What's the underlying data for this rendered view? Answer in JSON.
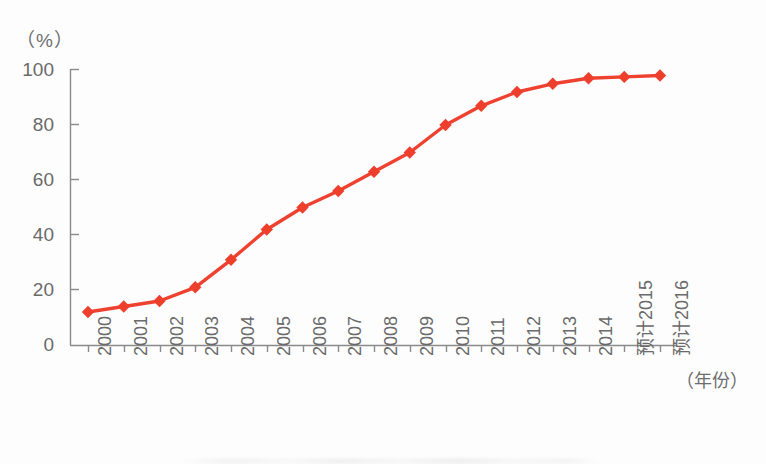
{
  "chart_data": {
    "type": "line",
    "title": "",
    "subtitle": "",
    "xlabel": "（年份）",
    "ylabel": "（%）",
    "ylim": [
      0,
      100
    ],
    "yticks": [
      0,
      20,
      40,
      60,
      80,
      100
    ],
    "grid": false,
    "legend": "none",
    "marker": "diamond",
    "series_color": "#ef4130",
    "categories": [
      "2000",
      "2001",
      "2002",
      "2003",
      "2004",
      "2005",
      "2006",
      "2007",
      "2008",
      "2009",
      "2010",
      "2011",
      "2012",
      "2013",
      "2014",
      "预计2015",
      "预计2016"
    ],
    "series": [
      {
        "name": "普及率",
        "values": [
          12,
          14,
          16,
          21,
          31,
          42,
          50,
          56,
          63,
          70,
          80,
          87,
          92,
          95,
          97,
          97.5,
          98
        ]
      }
    ]
  },
  "axis": {
    "y_unit_label": "（%）",
    "x_title": "（年份）",
    "y_tick_labels": [
      "100",
      "80",
      "60",
      "40",
      "20",
      "0"
    ],
    "x_tick_labels": [
      "2000",
      "2001",
      "2002",
      "2003",
      "2004",
      "2005",
      "2006",
      "2007",
      "2008",
      "2009",
      "2010",
      "2011",
      "2012",
      "2013",
      "2014",
      "预计2015",
      "预计2016"
    ]
  },
  "colors": {
    "line": "#ef4130",
    "marker": "#ee3f2d",
    "axis": "#8a8a8a",
    "text": "#6a6a6a",
    "background": "#fdfdfd"
  }
}
